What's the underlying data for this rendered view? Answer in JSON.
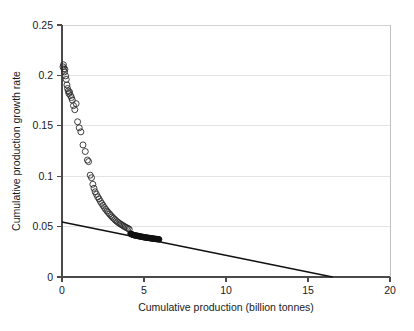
{
  "chart_data": {
    "type": "scatter",
    "title": "",
    "subtitle": "",
    "xlabel": "Cumulative production (billion tonnes)",
    "ylabel": "Cumulative production growth rate",
    "xlim": [
      0,
      20
    ],
    "ylim": [
      0,
      0.25
    ],
    "xticks": [
      0,
      5,
      10,
      15,
      20
    ],
    "xticklabels": [
      "0",
      "5",
      "10",
      "15",
      "20"
    ],
    "yticks": [
      0,
      0.05,
      0.1,
      0.15,
      0.2,
      0.25
    ],
    "yticklabels": [
      "0",
      "0.05",
      "0.1",
      "0.15",
      "0.2",
      "0.25"
    ],
    "grid": "horizontal",
    "legend": "none",
    "annotations": [],
    "series": [
      {
        "name": "Open circles (earlier cumulative production)",
        "marker": "open-circle",
        "color": "#2b2b2b",
        "points": [
          [
            0.06,
            0.2085
          ],
          [
            0.09,
            0.2105
          ],
          [
            0.12,
            0.2065
          ],
          [
            0.15,
            0.2035
          ],
          [
            0.18,
            0.206
          ],
          [
            0.22,
            0.1995
          ],
          [
            0.26,
            0.196
          ],
          [
            0.3,
            0.1905
          ],
          [
            0.34,
            0.187
          ],
          [
            0.38,
            0.1845
          ],
          [
            0.42,
            0.182
          ],
          [
            0.46,
            0.1835
          ],
          [
            0.52,
            0.18
          ],
          [
            0.58,
            0.178
          ],
          [
            0.63,
            0.1755
          ],
          [
            0.7,
            0.17
          ],
          [
            0.78,
            0.166
          ],
          [
            0.86,
            0.172
          ],
          [
            0.95,
            0.154
          ],
          [
            1.05,
            0.148
          ],
          [
            1.15,
            0.144
          ],
          [
            1.28,
            0.131
          ],
          [
            1.42,
            0.1245
          ],
          [
            1.55,
            0.116
          ],
          [
            1.62,
            0.1145
          ],
          [
            1.72,
            0.101
          ],
          [
            1.8,
            0.0985
          ],
          [
            1.88,
            0.092
          ],
          [
            1.95,
            0.088
          ],
          [
            2.02,
            0.0845
          ],
          [
            2.1,
            0.082
          ],
          [
            2.18,
            0.0795
          ],
          [
            2.26,
            0.0775
          ],
          [
            2.34,
            0.075
          ],
          [
            2.42,
            0.073
          ],
          [
            2.5,
            0.071
          ],
          [
            2.58,
            0.069
          ],
          [
            2.66,
            0.0672
          ],
          [
            2.74,
            0.0655
          ],
          [
            2.82,
            0.064
          ],
          [
            2.9,
            0.0625
          ],
          [
            2.98,
            0.061
          ],
          [
            3.06,
            0.0596
          ],
          [
            3.14,
            0.0583
          ],
          [
            3.22,
            0.057
          ],
          [
            3.3,
            0.0558
          ],
          [
            3.38,
            0.0547
          ],
          [
            3.46,
            0.0537
          ],
          [
            3.54,
            0.0528
          ],
          [
            3.62,
            0.052
          ],
          [
            3.7,
            0.0512
          ],
          [
            3.78,
            0.0503
          ],
          [
            3.86,
            0.0496
          ],
          [
            3.94,
            0.0489
          ],
          [
            4.02,
            0.0482
          ],
          [
            4.1,
            0.0474
          ]
        ]
      },
      {
        "name": "Filled circles (recent cumulative production)",
        "marker": "filled-circle",
        "color": "#111111",
        "points": [
          [
            4.18,
            0.043
          ],
          [
            4.24,
            0.0424
          ],
          [
            4.3,
            0.042
          ],
          [
            4.36,
            0.0417
          ],
          [
            4.42,
            0.0414
          ],
          [
            4.48,
            0.0412
          ],
          [
            4.54,
            0.041
          ],
          [
            4.6,
            0.0408
          ],
          [
            4.66,
            0.0406
          ],
          [
            4.72,
            0.0404
          ],
          [
            4.78,
            0.0402
          ],
          [
            4.84,
            0.04
          ],
          [
            4.9,
            0.0398
          ],
          [
            4.96,
            0.0396
          ],
          [
            5.02,
            0.0394
          ],
          [
            5.08,
            0.0393
          ],
          [
            5.14,
            0.0391
          ],
          [
            5.2,
            0.039
          ],
          [
            5.26,
            0.0388
          ],
          [
            5.32,
            0.0387
          ],
          [
            5.38,
            0.0385
          ],
          [
            5.44,
            0.0384
          ],
          [
            5.5,
            0.0382
          ],
          [
            5.56,
            0.0381
          ],
          [
            5.62,
            0.038
          ],
          [
            5.68,
            0.0378
          ],
          [
            5.74,
            0.0377
          ],
          [
            5.8,
            0.0376
          ],
          [
            5.86,
            0.0375
          ],
          [
            5.92,
            0.0374
          ]
        ]
      }
    ],
    "fit_line": {
      "name": "Linear fit (Hubbert trend)",
      "color": "#111111",
      "x0": 0.0,
      "y0": 0.0545,
      "x1": 16.5,
      "y1": 0.0,
      "x_intercept": 16.5,
      "y_intercept": 0.0545,
      "slope": -0.0033
    }
  }
}
